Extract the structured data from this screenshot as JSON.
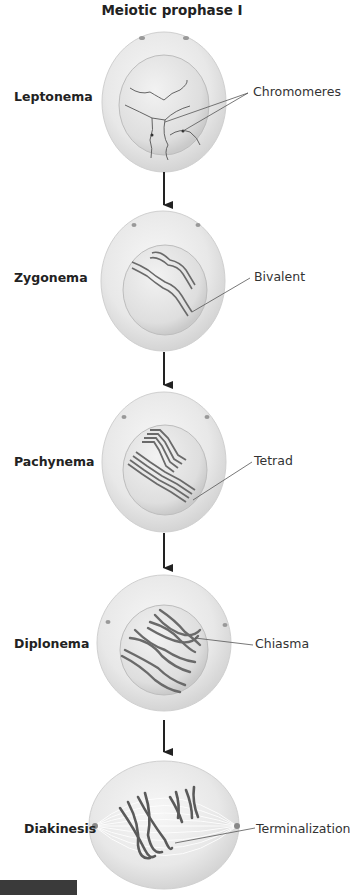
{
  "title": "Meiotic prophase I",
  "stages": [
    {
      "name": "Leptonema",
      "callout": "Chromomeres"
    },
    {
      "name": "Zygonema",
      "callout": "Bivalent"
    },
    {
      "name": "Pachynema",
      "callout": "Tetrad"
    },
    {
      "name": "Diplonema",
      "callout": "Chiasma"
    },
    {
      "name": "Diakinesis",
      "callout": "Terminalization"
    }
  ],
  "colors": {
    "cell_outer": "#e6e6e6",
    "nucleus": "#d9d9d9",
    "chromosome": "#6e6e6e",
    "line": "#555555",
    "arrow": "#222222"
  }
}
